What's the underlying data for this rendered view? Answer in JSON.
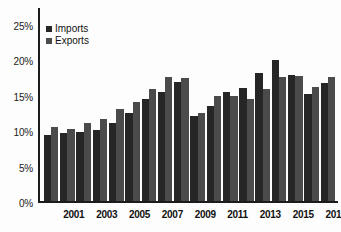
{
  "chart_data": {
    "type": "bar",
    "title": "",
    "subtitle": "",
    "xlabel": "",
    "ylabel": "",
    "ylim": [
      0,
      27.5
    ],
    "grid": false,
    "legend_position": "top-left",
    "y_ticks": [
      "0%",
      "5%",
      "10%",
      "15%",
      "20%",
      "25%"
    ],
    "y_tick_values": [
      0,
      5,
      10,
      15,
      20,
      25
    ],
    "categories": [
      "2000",
      "2001",
      "2002",
      "2003",
      "2004",
      "2005",
      "2006",
      "2007",
      "2008",
      "2009",
      "2010",
      "2011",
      "2012",
      "2013",
      "2014",
      "2015",
      "2016",
      "2017"
    ],
    "x_tick_labels": [
      "",
      "2001",
      "",
      "2003",
      "",
      "2005",
      "",
      "2007",
      "",
      "2009",
      "",
      "2011",
      "",
      "2013",
      "",
      "2015",
      "",
      "2017"
    ],
    "series": [
      {
        "name": "Imports",
        "color": "#262626",
        "values": [
          9.4,
          9.7,
          9.8,
          10.1,
          11.1,
          12.5,
          14.5,
          15.6,
          17.0,
          12.1,
          13.6,
          15.5,
          16.1,
          18.2,
          20.1,
          18.0,
          15.2,
          16.8
        ]
      },
      {
        "name": "Exports",
        "color": "#4b4b4b",
        "values": [
          10.6,
          10.2,
          11.1,
          11.7,
          13.1,
          14.1,
          16.0,
          17.6,
          17.5,
          12.6,
          14.9,
          14.9,
          14.6,
          15.9,
          17.6,
          17.8,
          16.2,
          17.7
        ]
      }
    ]
  }
}
